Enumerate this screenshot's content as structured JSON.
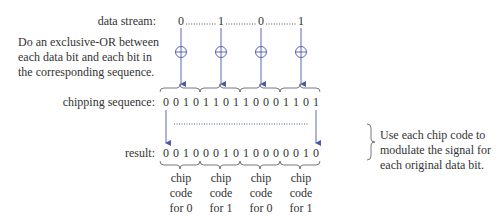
{
  "labels": {
    "data_stream": "data stream:",
    "chipping_sequence": "chipping sequence:",
    "result": "result:"
  },
  "instruction_note": [
    "Do an exclusive-OR between",
    "each data bit and each bit in",
    "the corresponding sequence."
  ],
  "modulate_note": [
    "Use each chip code to",
    "modulate the signal for",
    "each original data bit."
  ],
  "data_stream": [
    "0",
    "1",
    "0",
    "1"
  ],
  "chipping_sequence": [
    "0",
    "0",
    "1",
    "0",
    "1",
    "1",
    "0",
    "1",
    "1",
    "0",
    "0",
    "0",
    "1",
    "1",
    "0",
    "1"
  ],
  "result": [
    "0",
    "0",
    "1",
    "0",
    "0",
    "0",
    "1",
    "0",
    "1",
    "0",
    "0",
    "0",
    "0",
    "0",
    "1",
    "0"
  ],
  "chip_codes": [
    {
      "line1": "chip",
      "line2": "code",
      "line3": "for 0"
    },
    {
      "line1": "chip",
      "line2": "code",
      "line3": "for 1"
    },
    {
      "line1": "chip",
      "line2": "code",
      "line3": "for 0"
    },
    {
      "line1": "chip",
      "line2": "code",
      "line3": "for 1"
    }
  ],
  "colors": {
    "arrow": "#4a5aa8",
    "text": "#333333",
    "brace": "#555555"
  }
}
